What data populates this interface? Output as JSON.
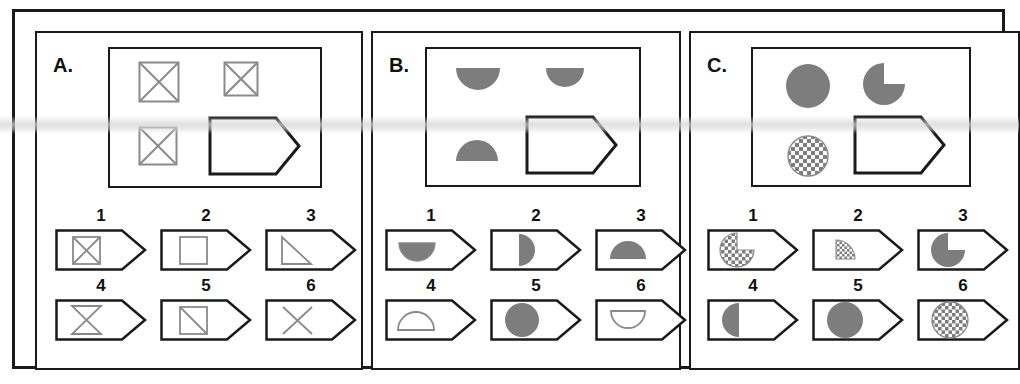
{
  "figure": {
    "type": "matrix-reasoning-test-items",
    "panel_count": 3
  },
  "panels": [
    {
      "letter": "A.",
      "matrix": {
        "cells": [
          {
            "name": "crossed-square",
            "fill": "none",
            "stroke": "#8a8a8a"
          },
          {
            "name": "crossed-square",
            "fill": "none",
            "stroke": "#8a8a8a"
          },
          {
            "name": "crossed-square",
            "fill": "none",
            "stroke": "#8a8a8a"
          },
          {
            "name": "answer-tag-empty",
            "fill": "none",
            "stroke": "#1a1a1a"
          }
        ]
      },
      "options": [
        {
          "num": "1",
          "shape": "crossed-square"
        },
        {
          "num": "2",
          "shape": "square"
        },
        {
          "num": "3",
          "shape": "right-triangle"
        },
        {
          "num": "4",
          "shape": "bowtie"
        },
        {
          "num": "5",
          "shape": "square-diagonal"
        },
        {
          "num": "6",
          "shape": "x-cross"
        }
      ]
    },
    {
      "letter": "B.",
      "matrix": {
        "cells": [
          {
            "name": "half-disc-bottom",
            "fill": "#7d7d7d",
            "stroke": "none"
          },
          {
            "name": "half-disc-bottom",
            "fill": "#7d7d7d",
            "stroke": "none"
          },
          {
            "name": "half-disc-top",
            "fill": "#7d7d7d",
            "stroke": "none"
          },
          {
            "name": "answer-tag-empty",
            "fill": "none",
            "stroke": "#1a1a1a"
          }
        ]
      },
      "options": [
        {
          "num": "1",
          "shape": "half-disc-bottom-filled"
        },
        {
          "num": "2",
          "shape": "half-disc-right-filled"
        },
        {
          "num": "3",
          "shape": "half-disc-top-filled"
        },
        {
          "num": "4",
          "shape": "half-disc-top-outline"
        },
        {
          "num": "5",
          "shape": "circle-filled"
        },
        {
          "num": "6",
          "shape": "half-disc-bottom-outline"
        }
      ]
    },
    {
      "letter": "C.",
      "matrix": {
        "cells": [
          {
            "name": "circle-filled",
            "fill": "#7d7d7d",
            "stroke": "none"
          },
          {
            "name": "pacman-missing-lower-right",
            "fill": "#7d7d7d",
            "stroke": "none"
          },
          {
            "name": "circle-checkered",
            "fill": "checker",
            "stroke": "#8a8a8a"
          },
          {
            "name": "answer-tag-empty",
            "fill": "none",
            "stroke": "#1a1a1a"
          }
        ]
      },
      "options": [
        {
          "num": "1",
          "shape": "pacman-checkered-missing-upper-right"
        },
        {
          "num": "2",
          "shape": "quarter-disc-checkered-upper-right"
        },
        {
          "num": "3",
          "shape": "pacman-gray-missing-lower-right"
        },
        {
          "num": "4",
          "shape": "half-disc-left-filled"
        },
        {
          "num": "5",
          "shape": "circle-filled"
        },
        {
          "num": "6",
          "shape": "circle-checkered"
        }
      ]
    }
  ],
  "colors": {
    "ink": "#1a1a1a",
    "gray_fill": "#7d7d7d",
    "light_stroke": "#8a8a8a",
    "paper": "#ffffff"
  }
}
